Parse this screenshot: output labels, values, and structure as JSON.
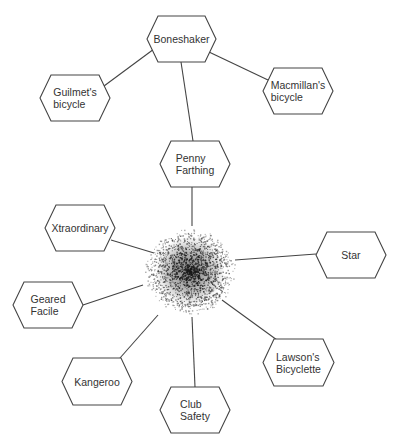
{
  "diagram": {
    "type": "radial-concept-map",
    "center": {
      "name": "hub",
      "x": 190,
      "y": 271,
      "radius": 46,
      "style": "stippled-dot-cloud"
    },
    "colors": {
      "stroke": "#444444",
      "text": "#333333",
      "background": "#ffffff",
      "dots": "#1a1a1a"
    },
    "nodes": [
      {
        "id": "boneshaker",
        "lines": [
          "Boneshaker"
        ],
        "x": 147,
        "y": 16,
        "w": 69,
        "h": 46
      },
      {
        "id": "guilmets-bicycle",
        "lines": [
          "Guilmet's",
          "bicycle"
        ],
        "x": 40,
        "y": 75,
        "w": 70,
        "h": 46
      },
      {
        "id": "macmillans-bicycle",
        "lines": [
          "Macmillan's",
          "bicycle"
        ],
        "x": 263,
        "y": 68,
        "w": 70,
        "h": 46
      },
      {
        "id": "penny-farthing",
        "lines": [
          "Penny",
          "Farthing"
        ],
        "x": 160,
        "y": 141,
        "w": 70,
        "h": 46
      },
      {
        "id": "xtraordinary",
        "lines": [
          "Xtraordinary"
        ],
        "x": 45,
        "y": 205,
        "w": 70,
        "h": 46
      },
      {
        "id": "star",
        "lines": [
          "Star"
        ],
        "x": 316,
        "y": 232,
        "w": 70,
        "h": 46
      },
      {
        "id": "geared-facile",
        "lines": [
          "Geared",
          "Facile"
        ],
        "x": 13,
        "y": 282,
        "w": 70,
        "h": 46
      },
      {
        "id": "lawsons-bicyclette",
        "lines": [
          "Lawson's",
          "Bicyclette"
        ],
        "x": 263,
        "y": 339,
        "w": 71,
        "h": 47
      },
      {
        "id": "kangeroo",
        "lines": [
          "Kangeroo"
        ],
        "x": 62,
        "y": 358,
        "w": 70,
        "h": 47
      },
      {
        "id": "club-safety",
        "lines": [
          "Club",
          "Safety"
        ],
        "x": 160,
        "y": 387,
        "w": 70,
        "h": 46
      }
    ],
    "edges": [
      {
        "from": "boneshaker",
        "to": "guilmets-bicycle",
        "x1": 154,
        "y1": 49,
        "x2": 104,
        "y2": 86
      },
      {
        "from": "boneshaker",
        "to": "macmillans-bicycle",
        "x1": 209,
        "y1": 52,
        "x2": 268,
        "y2": 80
      },
      {
        "from": "boneshaker",
        "to": "penny-farthing",
        "x1": 181,
        "y1": 62,
        "x2": 193,
        "y2": 141
      },
      {
        "from": "penny-farthing",
        "to": "hub",
        "x1": 192,
        "y1": 187,
        "x2": 192,
        "y2": 226
      },
      {
        "from": "xtraordinary",
        "to": "hub",
        "x1": 111,
        "y1": 240,
        "x2": 154,
        "y2": 253
      },
      {
        "from": "star",
        "to": "hub",
        "x1": 316,
        "y1": 254,
        "x2": 235,
        "y2": 260
      },
      {
        "from": "geared-facile",
        "to": "hub",
        "x1": 83,
        "y1": 305,
        "x2": 143,
        "y2": 285
      },
      {
        "from": "lawsons-bicyclette",
        "to": "hub",
        "x1": 277,
        "y1": 340,
        "x2": 222,
        "y2": 300
      },
      {
        "from": "kangeroo",
        "to": "hub",
        "x1": 120,
        "y1": 358,
        "x2": 158,
        "y2": 315
      },
      {
        "from": "club-safety",
        "to": "hub",
        "x1": 195,
        "y1": 387,
        "x2": 192,
        "y2": 317
      }
    ]
  }
}
